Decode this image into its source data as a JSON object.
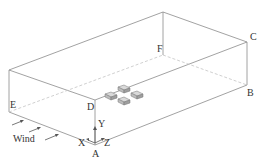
{
  "diagram": {
    "type": "isometric-domain-box",
    "corner_labels": {
      "A": "A",
      "B": "B",
      "C": "C",
      "D": "D",
      "E": "E",
      "F": "F"
    },
    "axes": {
      "x": "X",
      "y": "Y",
      "z": "Z"
    },
    "wind_label": "Wind",
    "building_block_count": 4,
    "colors": {
      "edge": "#8a8a8a",
      "hidden_edge": "#c4c4c4",
      "label": "#333333",
      "block": "#bdbdbd"
    }
  }
}
